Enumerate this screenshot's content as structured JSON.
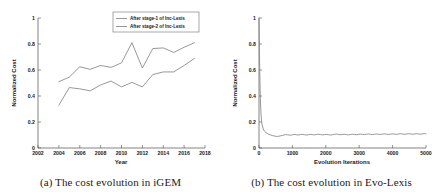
{
  "figure": {
    "panels": [
      {
        "id": "panel-a",
        "caption": "(a) The cost evolution in iGEM"
      },
      {
        "id": "panel-b",
        "caption": "(b) The cost evolution in Evo-Lexis"
      }
    ]
  },
  "chart_data": [
    {
      "type": "line",
      "title": "",
      "xlabel": "Year",
      "ylabel": "Normalized Cost",
      "xlim": [
        2002,
        2018
      ],
      "ylim": [
        0,
        1
      ],
      "xticks": [
        2002,
        2004,
        2006,
        2008,
        2010,
        2012,
        2014,
        2016,
        2018
      ],
      "xtick_labels": [
        "2002",
        "2004",
        "2006",
        "2008",
        "2010",
        "2012",
        "2014",
        "2016",
        "2018"
      ],
      "yticks": [
        0,
        0.2,
        0.4,
        0.6,
        0.8,
        1
      ],
      "ytick_labels": [
        "0",
        "0.2",
        "0.4",
        "0.6",
        "0.8",
        "1"
      ],
      "grid": false,
      "legend_position": "upper right",
      "x": [
        2004,
        2005,
        2006,
        2007,
        2008,
        2009,
        2010,
        2011,
        2012,
        2013,
        2014,
        2015,
        2016,
        2017
      ],
      "series": [
        {
          "name": "After stage-1 of Inc-Lexis",
          "color": "#7d7d7d",
          "values": [
            0.51,
            0.545,
            0.625,
            0.605,
            0.635,
            0.62,
            0.655,
            0.81,
            0.615,
            0.765,
            0.77,
            0.735,
            0.775,
            0.81
          ]
        },
        {
          "name": "After stage-2 of Inc-Lexis",
          "color": "#7d7d7d",
          "values": [
            0.33,
            0.465,
            0.455,
            0.44,
            0.485,
            0.515,
            0.47,
            0.505,
            0.47,
            0.565,
            0.585,
            0.585,
            0.635,
            0.69
          ]
        }
      ]
    },
    {
      "type": "line",
      "title": "",
      "xlabel": "Evolution Iterations",
      "ylabel": "Normalized Cost",
      "xlim": [
        0,
        5000
      ],
      "ylim": [
        0,
        1
      ],
      "xticks": [
        0,
        1000,
        2000,
        3000,
        4000,
        5000
      ],
      "xtick_labels": [
        "0",
        "1000",
        "2000",
        "3000",
        "4000",
        "5000"
      ],
      "yticks": [
        0,
        0.2,
        0.4,
        0.6,
        0.8,
        1
      ],
      "ytick_labels": [
        "0",
        "0.2",
        "0.4",
        "0.6",
        "0.8",
        "1"
      ],
      "grid": false,
      "legend_position": "none",
      "series": [
        {
          "name": "Evo-Lexis normalized cost",
          "color": "#8a8a8a",
          "x": [
            0,
            20,
            40,
            60,
            80,
            100,
            130,
            160,
            200,
            250,
            300,
            350,
            400,
            450,
            500,
            550,
            600,
            650,
            700,
            750,
            800,
            850,
            900,
            950,
            1000,
            1060,
            1120,
            1180,
            1240,
            1300,
            1360,
            1420,
            1480,
            1540,
            1600,
            1660,
            1720,
            1780,
            1840,
            1900,
            1960,
            2020,
            2080,
            2140,
            2200,
            2260,
            2320,
            2380,
            2440,
            2500,
            2560,
            2620,
            2680,
            2740,
            2800,
            2860,
            2920,
            2980,
            3040,
            3100,
            3160,
            3220,
            3280,
            3340,
            3400,
            3460,
            3520,
            3580,
            3640,
            3700,
            3760,
            3820,
            3880,
            3940,
            4000,
            4060,
            4120,
            4180,
            4240,
            4300,
            4360,
            4420,
            4480,
            4540,
            4600,
            4660,
            4720,
            4780,
            4840,
            4900,
            4950,
            5000
          ],
          "values": [
            1.0,
            0.62,
            0.38,
            0.26,
            0.2,
            0.17,
            0.145,
            0.13,
            0.12,
            0.112,
            0.105,
            0.1,
            0.096,
            0.093,
            0.09,
            0.089,
            0.091,
            0.094,
            0.097,
            0.1,
            0.103,
            0.102,
            0.1,
            0.099,
            0.101,
            0.104,
            0.102,
            0.1,
            0.103,
            0.105,
            0.102,
            0.1,
            0.102,
            0.105,
            0.103,
            0.101,
            0.104,
            0.106,
            0.103,
            0.101,
            0.103,
            0.105,
            0.102,
            0.1,
            0.102,
            0.105,
            0.107,
            0.104,
            0.102,
            0.104,
            0.106,
            0.103,
            0.101,
            0.104,
            0.106,
            0.104,
            0.102,
            0.105,
            0.107,
            0.105,
            0.103,
            0.106,
            0.108,
            0.105,
            0.103,
            0.106,
            0.108,
            0.106,
            0.104,
            0.107,
            0.109,
            0.106,
            0.104,
            0.107,
            0.109,
            0.107,
            0.105,
            0.108,
            0.11,
            0.107,
            0.105,
            0.108,
            0.11,
            0.108,
            0.106,
            0.108,
            0.11,
            0.108,
            0.106,
            0.109,
            0.111,
            0.109,
            0.108,
            0.11
          ]
        }
      ]
    }
  ]
}
